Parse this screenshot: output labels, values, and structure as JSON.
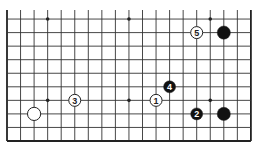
{
  "diagram": {
    "grid": {
      "columns": 19,
      "visible_rows": 10,
      "origin_x": 7,
      "origin_y": 141,
      "spacing": 13.55,
      "line_color": "#333333",
      "edge_color": "#222222"
    },
    "hoshi": [
      {
        "col": 3,
        "row": 9
      },
      {
        "col": 9,
        "row": 9
      },
      {
        "col": 15,
        "row": 9
      },
      {
        "col": 3,
        "row": 3
      },
      {
        "col": 9,
        "row": 3
      },
      {
        "col": 15,
        "row": 3
      }
    ],
    "stones": [
      {
        "color": "white",
        "col": 2,
        "row": 2,
        "label": ""
      },
      {
        "color": "black",
        "col": 16,
        "row": 8,
        "label": ""
      },
      {
        "color": "black",
        "col": 16,
        "row": 2,
        "label": ""
      },
      {
        "color": "white",
        "col": 11,
        "row": 3,
        "label": "1"
      },
      {
        "color": "black",
        "col": 14,
        "row": 2,
        "label": "2"
      },
      {
        "color": "white",
        "col": 5,
        "row": 3,
        "label": "3"
      },
      {
        "color": "black",
        "col": 12,
        "row": 4,
        "label": "4"
      },
      {
        "color": "white",
        "col": 14,
        "row": 8,
        "label": "5"
      }
    ]
  }
}
